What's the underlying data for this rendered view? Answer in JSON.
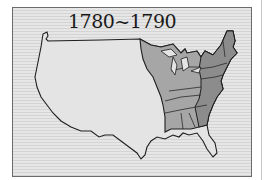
{
  "map": {
    "title": "1780~1790",
    "subject": "United States territory",
    "regions": [
      {
        "name": "western-territory",
        "fill": "#e4e4e4"
      },
      {
        "name": "eastern-states-light",
        "fill": "#a6a6a6"
      },
      {
        "name": "eastern-states-dark",
        "fill": "#8c8c8c"
      }
    ],
    "colors": {
      "outline": "#1e1e1e",
      "background_stripe_light": "#e6e6e6",
      "background_stripe_dark": "#d4d4d4",
      "frame_border": "#6b6b6b"
    }
  }
}
